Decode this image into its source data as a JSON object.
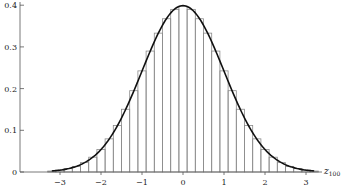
{
  "chart_data": {
    "type": "bar",
    "title": "",
    "xlabel": "z_100",
    "xlabel_main": "z",
    "xlabel_sub": "100",
    "ylabel": "",
    "xlim": [
      -3.4,
      3.4
    ],
    "ylim": [
      0,
      0.4
    ],
    "grid": false,
    "legend": null,
    "x_ticks": [
      -3,
      -2,
      -1,
      0,
      1,
      2,
      3
    ],
    "x_tick_labels": [
      "−3",
      "−2",
      "−1",
      "0",
      "1",
      "2",
      "3"
    ],
    "y_ticks": [
      0,
      0.1,
      0.2,
      0.3,
      0.4
    ],
    "y_tick_labels": [
      "0",
      "0.1",
      "0.2",
      "0.3",
      "0.4"
    ],
    "bin_width": 0.2,
    "series": [
      {
        "name": "histogram (standardized Binomial(100, 0.5))",
        "kind": "bar",
        "bin_centers": [
          -3.2,
          -3.0,
          -2.8,
          -2.6,
          -2.4,
          -2.2,
          -2.0,
          -1.8,
          -1.6,
          -1.4,
          -1.2,
          -1.0,
          -0.8,
          -0.6,
          -0.4,
          -0.2,
          0.0,
          0.2,
          0.4,
          0.6,
          0.8,
          1.0,
          1.2,
          1.4,
          1.6,
          1.8,
          2.0,
          2.2,
          2.4,
          2.6,
          2.8,
          3.0,
          3.2
        ],
        "values": [
          0.0023,
          0.0045,
          0.008,
          0.0135,
          0.0225,
          0.0355,
          0.054,
          0.0795,
          0.1115,
          0.1505,
          0.195,
          0.2425,
          0.29,
          0.333,
          0.3675,
          0.39,
          0.398,
          0.39,
          0.3675,
          0.333,
          0.29,
          0.2425,
          0.195,
          0.1505,
          0.1115,
          0.0795,
          0.054,
          0.0355,
          0.0225,
          0.0135,
          0.008,
          0.0045,
          0.0023
        ]
      },
      {
        "name": "standard normal density",
        "kind": "line",
        "x_range": [
          -3.2,
          3.2
        ]
      }
    ]
  },
  "colors": {
    "bar_stroke": "#8a8a8a",
    "curve": "#111111",
    "axis": "#555555",
    "background": "#ffffff"
  }
}
